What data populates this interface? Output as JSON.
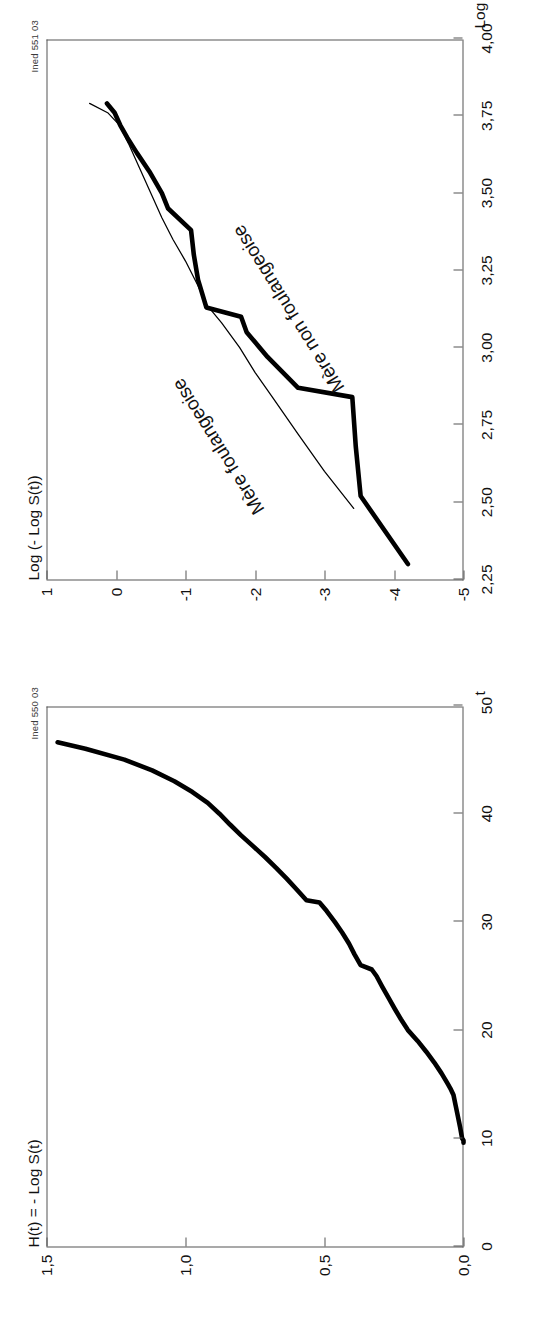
{
  "figure": {
    "orientation": "rotated-90-ccw",
    "panels": [
      {
        "id": "panel-a",
        "source_note": "Ined 550 03",
        "y_axis_title": "H(t) = - Log S(t)",
        "x_axis_title": "t"
      },
      {
        "id": "panel-b",
        "source_note": "Ined 551 03",
        "y_axis_title": "Log (- Log S(t))",
        "x_axis_title": "Log (t)"
      }
    ]
  },
  "labels": {
    "mere_foulangeoise": "Mère foulangeoise",
    "mere_non_foulangeoise": "Mère non foulangeoise"
  },
  "colors": {
    "curve": "#000000",
    "axis": "#555555",
    "text": "#111111",
    "background": "#ffffff"
  },
  "chart_data": [
    {
      "type": "line",
      "id": "panel-a",
      "title": "",
      "xlabel": "t",
      "ylabel": "H(t) = - Log S(t)",
      "xlim": [
        0,
        50
      ],
      "ylim": [
        0.0,
        1.5
      ],
      "grid": false,
      "legend": "none",
      "xticks": [
        0,
        10,
        20,
        30,
        40,
        50
      ],
      "xticklabels": [
        "0",
        "10",
        "20",
        "30",
        "40",
        "50"
      ],
      "yticks": [
        0.0,
        0.5,
        1.0,
        1.5
      ],
      "yticklabels": [
        "0,0",
        "0,5",
        "1,0",
        "1,5"
      ],
      "series": [
        {
          "name": "cumulative-hazard",
          "style": "thick",
          "x": [
            9.6,
            9.8,
            10.0,
            11.0,
            12.0,
            13.0,
            14.0,
            14.6,
            15.0,
            16.0,
            17.0,
            18.0,
            19.0,
            20.0,
            21.0,
            22.0,
            23.0,
            24.0,
            25.0,
            25.6,
            26.0,
            27.0,
            28.0,
            29.0,
            30.0,
            31.0,
            31.8,
            32.0,
            33.0,
            34.0,
            35.0,
            36.0,
            37.0,
            38.0,
            39.0,
            40.0,
            41.0,
            42.0,
            43.0,
            44.0,
            45.0,
            46.0,
            46.6
          ],
          "y": [
            0.0,
            0.0,
            0.005,
            0.012,
            0.02,
            0.028,
            0.036,
            0.047,
            0.056,
            0.079,
            0.105,
            0.134,
            0.165,
            0.2,
            0.225,
            0.248,
            0.27,
            0.292,
            0.313,
            0.33,
            0.37,
            0.392,
            0.412,
            0.436,
            0.463,
            0.492,
            0.518,
            0.565,
            0.6,
            0.636,
            0.674,
            0.714,
            0.757,
            0.8,
            0.84,
            0.878,
            0.92,
            0.975,
            1.04,
            1.12,
            1.22,
            1.36,
            1.46
          ]
        }
      ]
    },
    {
      "type": "line",
      "id": "panel-b",
      "title": "",
      "xlabel": "Log (t)",
      "ylabel": "Log (- Log S(t))",
      "xlim": [
        2.25,
        4.0
      ],
      "ylim": [
        -5,
        1
      ],
      "grid": false,
      "legend": "inline-annotations",
      "xticks": [
        2.25,
        2.5,
        2.75,
        3.0,
        3.25,
        3.5,
        3.75,
        4.0
      ],
      "xticklabels": [
        "2,25",
        "2,50",
        "2,75",
        "3,00",
        "3,25",
        "3,50",
        "3,75",
        "4,00"
      ],
      "yticks": [
        -5,
        -4,
        -3,
        -2,
        -1,
        0,
        1
      ],
      "yticklabels": [
        "-5",
        "-4",
        "-3",
        "-2",
        "-1",
        "0",
        "1"
      ],
      "series": [
        {
          "name": "Mère non foulangeoise",
          "style": "thick",
          "x": [
            2.3,
            2.52,
            2.68,
            2.84,
            2.87,
            2.97,
            3.05,
            3.1,
            3.13,
            3.22,
            3.3,
            3.38,
            3.45,
            3.5,
            3.57,
            3.63,
            3.68,
            3.72,
            3.76,
            3.79
          ],
          "y": [
            -4.2,
            -3.52,
            -3.45,
            -3.4,
            -2.62,
            -2.18,
            -1.88,
            -1.8,
            -1.3,
            -1.18,
            -1.12,
            -1.08,
            -0.75,
            -0.66,
            -0.48,
            -0.3,
            -0.16,
            -0.06,
            0.02,
            0.13
          ]
        },
        {
          "name": "Mère foulangeoise",
          "style": "thin",
          "x": [
            2.48,
            2.6,
            2.72,
            2.84,
            2.92,
            3.0,
            3.08,
            3.14,
            3.2,
            3.28,
            3.35,
            3.42,
            3.5,
            3.58,
            3.66,
            3.72,
            3.76,
            3.79
          ],
          "y": [
            -3.42,
            -3.0,
            -2.62,
            -2.25,
            -2.0,
            -1.78,
            -1.52,
            -1.3,
            -1.18,
            -1.0,
            -0.82,
            -0.66,
            -0.5,
            -0.34,
            -0.18,
            -0.05,
            0.12,
            0.38
          ]
        }
      ]
    }
  ]
}
